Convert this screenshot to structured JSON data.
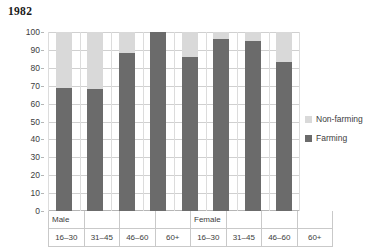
{
  "chart_data": {
    "type": "bar",
    "variant": "stacked-100-percent",
    "title": "1982",
    "xlabel": "",
    "ylabel": "",
    "ylim": [
      0,
      100
    ],
    "ytick_step": 10,
    "yticks": [
      100,
      90,
      80,
      70,
      60,
      50,
      40,
      30,
      20,
      10,
      0
    ],
    "grid": true,
    "grid_axis": "both",
    "legend_position": "right",
    "groups": [
      "Male",
      "Female"
    ],
    "categories": [
      "16–30",
      "31–45",
      "46–60",
      "60+",
      "16–30",
      "31–45",
      "46–60",
      "60+"
    ],
    "group_of_category": [
      "Male",
      "Male",
      "Male",
      "Male",
      "Female",
      "Female",
      "Female",
      "Female"
    ],
    "series": [
      {
        "name": "Farming",
        "color": "#6b6b6b",
        "values": [
          69,
          68,
          88,
          100,
          86,
          96,
          95,
          83
        ]
      },
      {
        "name": "Non-farming",
        "color": "#d9d9d9",
        "values": [
          31,
          32,
          12,
          0,
          14,
          4,
          5,
          17
        ]
      }
    ],
    "legend_entries": [
      {
        "label": "Non-farming",
        "color": "#d9d9d9"
      },
      {
        "label": "Farming",
        "color": "#6b6b6b"
      }
    ]
  },
  "axis": {
    "y_tick_labels": [
      "100",
      "90",
      "80",
      "70",
      "60",
      "50",
      "40",
      "30",
      "20",
      "10",
      "0"
    ],
    "x_group_labels": [
      "Male",
      "Female"
    ],
    "x_age_labels": [
      "16–30",
      "31–45",
      "46–60",
      "60+",
      "16–30",
      "31–45",
      "46–60",
      "60+"
    ]
  },
  "colors": {
    "farming": "#6b6b6b",
    "non_farming": "#d9d9d9",
    "gridline": "#d0d0d0",
    "axis_line": "#b5b5b5",
    "text": "#3d3d3d",
    "title": "#1a1a1a",
    "background": "#ffffff"
  }
}
